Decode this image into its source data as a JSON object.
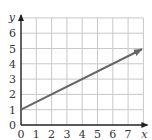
{
  "chart_data": {
    "type": "line",
    "title": "",
    "xlabel": "x",
    "ylabel": "y",
    "xlim": [
      0,
      8
    ],
    "ylim": [
      0,
      7
    ],
    "grid": true,
    "x_ticks": [
      0,
      1,
      2,
      3,
      4,
      5,
      6,
      7
    ],
    "y_ticks": [
      0,
      1,
      2,
      3,
      4,
      5,
      6
    ],
    "series": [
      {
        "name": "line",
        "x": [
          0,
          7.9
        ],
        "y": [
          1,
          4.95
        ],
        "equation": "y = 0.5x + 1",
        "arrow_end": true,
        "color": "#666666"
      }
    ],
    "colors": {
      "grid": "#c8c8c8",
      "axis": "#222222",
      "line": "#666666"
    }
  }
}
